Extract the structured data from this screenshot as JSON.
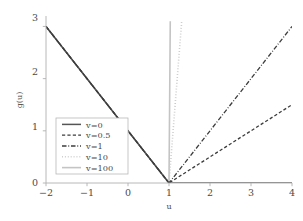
{
  "chart_data": {
    "type": "line",
    "title": "",
    "subtitle": "",
    "xlabel": "u",
    "ylabel": "g(u)",
    "xlim": [
      -2,
      4
    ],
    "ylim": [
      0,
      3.2
    ],
    "xticks": [
      -2,
      -1,
      0,
      1,
      2,
      3,
      4
    ],
    "xtick_labels": [
      "−2",
      "−1",
      "0",
      "1",
      "2",
      "3",
      "4"
    ],
    "yticks": [
      0,
      1,
      2,
      3
    ],
    "ytick_labels": [
      "0",
      "1",
      "2",
      "3"
    ],
    "grid": false,
    "legend_position": "lower-left-inside",
    "annotations": [],
    "series": [
      {
        "name": "v=0",
        "label": "v=0",
        "v": 0,
        "style": "solid",
        "color": "#555555",
        "width": 1.5,
        "points": [
          [
            -2,
            3
          ],
          [
            1,
            0
          ],
          [
            4,
            0
          ]
        ],
        "right_slope": 0
      },
      {
        "name": "v=0.5",
        "label": "v=0.5",
        "v": 0.5,
        "style": "dashed",
        "color": "#3c3c3c",
        "width": 1.3,
        "points": [
          [
            -2,
            3
          ],
          [
            1,
            0
          ],
          [
            4,
            1.5
          ]
        ],
        "right_slope": 0.5
      },
      {
        "name": "v=1",
        "label": "v=1",
        "v": 1,
        "style": "dashdot",
        "color": "#3c3c3c",
        "width": 1.3,
        "points": [
          [
            -2,
            3
          ],
          [
            1,
            0
          ],
          [
            4,
            3
          ]
        ],
        "right_slope": 1
      },
      {
        "name": "v=10",
        "label": "v=10",
        "v": 10,
        "style": "dotted",
        "color": "#c9c9c9",
        "width": 1.6,
        "points": [
          [
            -2,
            3
          ],
          [
            1,
            0
          ],
          [
            1.31,
            3.1
          ]
        ],
        "right_slope": 10
      },
      {
        "name": "v=100",
        "label": "v=100",
        "v": 100,
        "style": "solid",
        "color": "#c4c4c4",
        "width": 1.6,
        "points": [
          [
            -2,
            3
          ],
          [
            1,
            0
          ],
          [
            1.031,
            3.1
          ]
        ],
        "right_slope": 100
      }
    ]
  },
  "axes": {
    "x_axis_label": "u",
    "y_axis_label": "g(u)",
    "x_tick_0": "−2",
    "x_tick_1": "−1",
    "x_tick_2": "0",
    "x_tick_3": "1",
    "x_tick_4": "2",
    "x_tick_5": "3",
    "x_tick_6": "4",
    "y_tick_0": "0",
    "y_tick_1": "1",
    "y_tick_2": "2",
    "y_tick_3": "3"
  },
  "legend": {
    "entries": [
      {
        "label": "v=0"
      },
      {
        "label": "v=0.5"
      },
      {
        "label": "v=1"
      },
      {
        "label": "v=10"
      },
      {
        "label": "v=100"
      }
    ]
  },
  "colors": {
    "axis": "#b0b0b0",
    "text": "#4a4a4a",
    "dark_line": "#3c3c3c",
    "mid_line": "#555555",
    "light_line": "#c6c6c6",
    "legend_border": "#b8b8b8",
    "background": "#ffffff"
  }
}
